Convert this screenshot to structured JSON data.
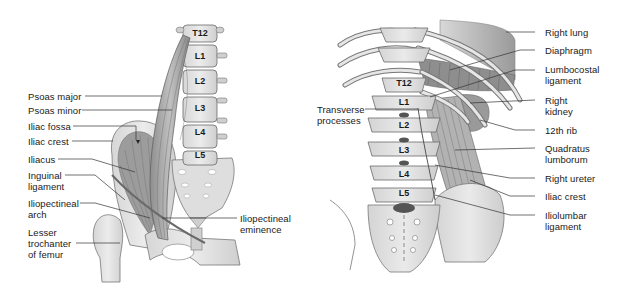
{
  "figure": {
    "left_panel": {
      "view": "anterior view of iliopsoas and lumbar spine",
      "vertebrae": [
        "T12",
        "L1",
        "L2",
        "L3",
        "L4",
        "L5"
      ],
      "labels": [
        {
          "id": "psoas-major",
          "text": "Psoas major"
        },
        {
          "id": "psoas-minor",
          "text": "Psoas minor"
        },
        {
          "id": "iliac-fossa",
          "text": "Iliac fossa"
        },
        {
          "id": "iliac-crest",
          "text": "Iliac crest"
        },
        {
          "id": "iliacus",
          "text": "Iliacus"
        },
        {
          "id": "inguinal-ligament",
          "text": "Inguinal\nligament"
        },
        {
          "id": "iliopectineal-arch",
          "text": "Iliopectineal\narch"
        },
        {
          "id": "lesser-trochanter",
          "text": "Lesser\ntrochanter\nof femur"
        },
        {
          "id": "iliopectineal-eminence",
          "text": "Iliopectineal\neminence"
        }
      ]
    },
    "right_panel": {
      "view": "posterior view of quadratus lumborum and lumbar spine",
      "vertebrae": [
        "T12",
        "L1",
        "L2",
        "L3",
        "L4",
        "L5"
      ],
      "labels": [
        {
          "id": "transverse-processes",
          "text": "Transverse\nprocesses"
        },
        {
          "id": "right-lung",
          "text": "Right lung"
        },
        {
          "id": "diaphragm",
          "text": "Diaphragm"
        },
        {
          "id": "lumbocostal-ligament",
          "text": "Lumbocostal\nligament"
        },
        {
          "id": "right-kidney",
          "text": "Right\nkidney"
        },
        {
          "id": "12th-rib",
          "text": "12th rib"
        },
        {
          "id": "quadratus-lumborum",
          "text": "Quadratus\nlumborum"
        },
        {
          "id": "right-ureter",
          "text": "Right ureter"
        },
        {
          "id": "iliac-crest-right",
          "text": "Iliac crest"
        },
        {
          "id": "iliolumbar-ligament",
          "text": "Iliolumbar\nligament"
        }
      ]
    },
    "colors": {
      "bone": "#e4e4e4",
      "bone_outline": "#6a6a6a",
      "muscle": "#a8a8a8",
      "muscle_dark": "#7d7d7d",
      "disc": "#555555",
      "leader_line": "#333333",
      "text": "#1a1a1a"
    }
  }
}
